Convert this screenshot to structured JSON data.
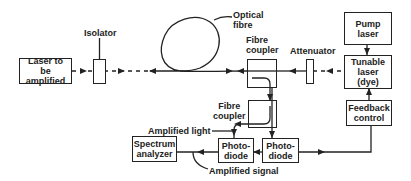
{
  "diagram": {
    "components": {
      "laser_to_amplify": "Laser to be amplified",
      "laser_line1": "Laser to",
      "laser_line2": "be amplified",
      "isolator": "Isolator",
      "optical_fibre_line1": "Optical",
      "optical_fibre_line2": "fibre",
      "fibre_coupler_top_line1": "Fibre",
      "fibre_coupler_top_line2": "coupler",
      "attenuator": "Attenuator",
      "pump_laser_line1": "Pump",
      "pump_laser_line2": "laser",
      "tunable_laser_line1": "Tunable",
      "tunable_laser_line2": "laser",
      "tunable_laser_line3": "(dye)",
      "feedback_control_line1": "Feedback",
      "feedback_control_line2": "control",
      "fibre_coupler_bottom_line1": "Fibre",
      "fibre_coupler_bottom_line2": "coupler",
      "photodiode_right_line1": "Photo-",
      "photodiode_right_line2": "diode",
      "photodiode_left_line1": "Photo-",
      "photodiode_left_line2": "diode",
      "spectrum_analyzer_line1": "Spectrum",
      "spectrum_analyzer_line2": "analyzer"
    },
    "annotations": {
      "amplified_light": "Amplified light",
      "amplified_signal": "Amplified signal"
    },
    "colors": {
      "line": "#222222",
      "background": "#ffffff"
    }
  }
}
